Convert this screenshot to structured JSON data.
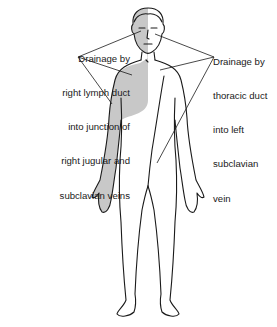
{
  "diagram": {
    "labels": {
      "right_lymph_duct": {
        "lines": [
          "Drainage by",
          "right lymph duct",
          "into junction of",
          "right jugular and",
          "subclavian veins"
        ]
      },
      "thoracic_duct": {
        "lines": [
          "Drainage by",
          "thoracic duct",
          "into left",
          "subclavian",
          "vein"
        ]
      }
    },
    "colors": {
      "shaded_region": "#c8c8c8",
      "outline": "#1a1a1a",
      "background": "#ffffff"
    }
  }
}
